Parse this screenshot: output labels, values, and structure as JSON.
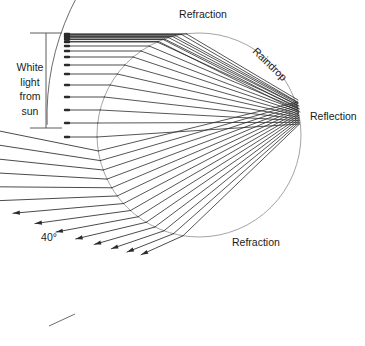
{
  "figure": {
    "title_visible": false,
    "background_color": "#ffffff",
    "width": 365,
    "height": 346
  },
  "labels": {
    "refraction_top": "Refraction",
    "raindrop": "Raindrop",
    "reflection": "Reflection",
    "refraction_bottom": "Refraction",
    "white_light_lines": [
      "White",
      "light",
      "from",
      "sun"
    ],
    "angle": "40°"
  },
  "colors": {
    "ray": "#2b2b2b",
    "drop_outline": "#9a9a9a",
    "arc": "#5a5a5a",
    "bracket": "#4a4a4a",
    "text": "#1a1a1a"
  },
  "geometry": {
    "drop": {
      "cx": 199,
      "cy": 135,
      "r": 102
    },
    "reflection_point": {
      "x": 299,
      "y": 116
    },
    "incoming_ray_start_x": 65,
    "bracket": {
      "x": 46,
      "y_top": 33,
      "y_bottom": 128,
      "tick_half_width": 16
    },
    "arc": {
      "cx": 299,
      "cy": 116,
      "r": 252,
      "start_angle_deg": 178,
      "end_angle_deg": 232
    },
    "arc_end_tick": {
      "x": 62,
      "y": 320
    },
    "ray_count": 14,
    "impact_parameters": [
      0.12,
      0.26,
      0.38,
      0.48,
      0.57,
      0.65,
      0.72,
      0.785,
      0.84,
      0.885,
      0.925,
      0.955,
      0.978,
      0.995
    ],
    "entry_y_offsets": [
      -100.5,
      -98.5,
      -96,
      -93,
      -89,
      -84,
      -78,
      -70,
      -61,
      -50,
      -38,
      -25,
      -12,
      2
    ]
  },
  "label_positions": {
    "refraction_top": {
      "x": 203,
      "y": 18,
      "anchor": "middle"
    },
    "raindrop": {
      "x": 252,
      "y": 52,
      "anchor": "start",
      "rotate": 44
    },
    "reflection": {
      "x": 310,
      "y": 120,
      "anchor": "start"
    },
    "refraction_bottom": {
      "x": 232,
      "y": 246,
      "anchor": "start"
    },
    "white_light": {
      "x": 30,
      "y": 71,
      "line_height": 14.5,
      "anchor": "middle"
    },
    "angle": {
      "x": 49,
      "y": 241,
      "anchor": "middle"
    }
  }
}
